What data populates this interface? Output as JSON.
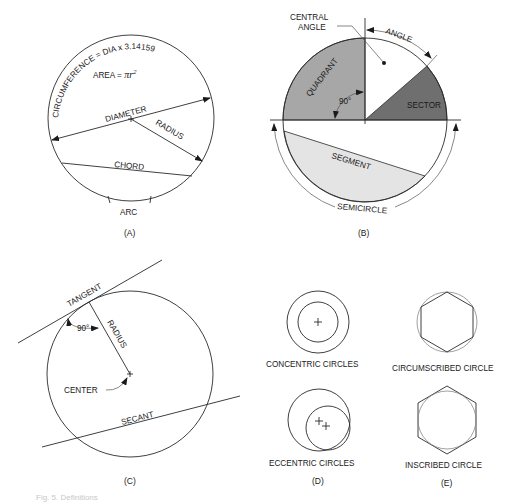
{
  "figure": {
    "caption_partial": "Fig. 5. Definitions",
    "panels": {
      "A": {
        "label": "(A)",
        "circumference_text": "CIRCUMFERENCE = DIA x 3.14159",
        "area_text": "AREA = ",
        "area_formula_pi_r": "πr",
        "area_formula_exp": "2",
        "diameter": "DIAMETER",
        "radius": "RADIUS",
        "chord": "CHORD",
        "arc": "ARC"
      },
      "B": {
        "label": "(B)",
        "central_angle_line1": "CENTRAL",
        "central_angle_line2": "ANGLE",
        "angle": "ANGLE",
        "quadrant": "QUADRANT",
        "ninety": "90°",
        "sector": "SECTOR",
        "segment": "SEGMENT",
        "semicircle": "SEMICIRCLE",
        "colors": {
          "quadrant": "#a7a7a7",
          "sector": "#6f6f6f",
          "segment": "#e4e4e4"
        }
      },
      "C": {
        "label": "(C)",
        "tangent": "TANGENT",
        "radius": "RADIUS",
        "ninety": "90°",
        "center": "CENTER",
        "secant": "SECANT"
      },
      "D": {
        "label": "(D)",
        "concentric": "CONCENTRIC CIRCLES",
        "eccentric": "ECCENTRIC CIRCLES"
      },
      "E": {
        "label": "(E)",
        "circumscribed": "CIRCUMSCRIBED CIRCLE",
        "inscribed": "INSCRIBED CIRCLE"
      }
    }
  }
}
